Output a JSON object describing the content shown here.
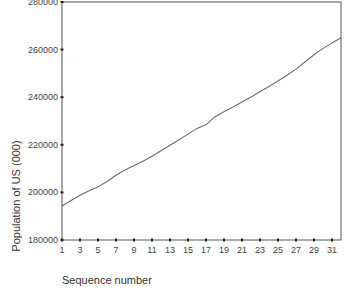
{
  "chart_data": {
    "type": "line",
    "title": "",
    "xlabel": "Sequence number",
    "ylabel": "Population of US (000)",
    "x_ticks": [
      1,
      3,
      5,
      7,
      9,
      11,
      13,
      15,
      17,
      19,
      21,
      23,
      25,
      27,
      29,
      31
    ],
    "y_ticks": [
      180000,
      200000,
      220000,
      240000,
      260000,
      280000
    ],
    "xlim": [
      1,
      32
    ],
    "ylim": [
      180000,
      280000
    ],
    "grid": false,
    "legend": null,
    "series": [
      {
        "name": "Population of US (000)",
        "x": [
          1,
          2,
          3,
          4,
          5,
          6,
          7,
          8,
          9,
          10,
          11,
          12,
          13,
          14,
          15,
          16,
          17,
          18,
          19,
          20,
          21,
          22,
          23,
          24,
          25,
          26,
          27,
          28,
          29,
          30,
          31,
          32
        ],
        "values": [
          194300,
          196600,
          198800,
          200700,
          202300,
          204600,
          207200,
          209400,
          211300,
          213100,
          215200,
          217500,
          219800,
          222100,
          224500,
          226900,
          228400,
          231800,
          233900,
          235900,
          238000,
          240100,
          242300,
          244500,
          246800,
          249200,
          251800,
          254800,
          257800,
          260500,
          262800,
          265000
        ]
      }
    ],
    "line_color": "#6e6e6e",
    "frame_color": "#555555"
  }
}
